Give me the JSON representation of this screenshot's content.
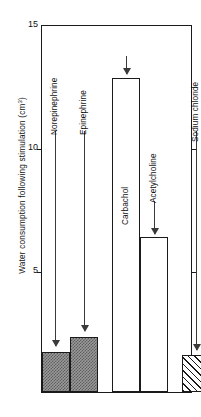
{
  "chart_data": {
    "type": "bar",
    "title": "",
    "xlabel": "",
    "ylabel": "Water consumption following stimulation (cm3)",
    "ylabel_main": "Water consumption  following  stimulation  (cm",
    "ylabel_exponent": "3",
    "ylabel_close": ")",
    "ylim": [
      0,
      15
    ],
    "yticks": [
      15,
      10,
      5
    ],
    "ytick_labels": [
      "15",
      "10",
      "5"
    ],
    "grid": false,
    "legend": "none",
    "categories": [
      "Norepinephrine",
      "Epinephrine",
      "Carbachol",
      "Acetylcholine",
      "Sodium chloride"
    ],
    "values": [
      1.65,
      2.25,
      12.8,
      6.3,
      1.5
    ],
    "bar_fills": [
      "checker",
      "checker",
      "none",
      "none",
      "hatch"
    ],
    "annotations": [
      {
        "label": "Norepinephrine",
        "points_to": "Norepinephrine"
      },
      {
        "label": "Epinephrine",
        "points_to": "Epinephrine"
      },
      {
        "label": "Carbachol",
        "points_to": "Carbachol"
      },
      {
        "label": "Acetylcholine",
        "points_to": "Acetylcholine"
      },
      {
        "label": "Sodium chloride",
        "points_to": "Sodium chloride"
      }
    ],
    "colors": {
      "axis": "#1a1a1a",
      "checker_fill": "#9a9a9a",
      "hatch_line": "#1a1a1a",
      "bar_outline": "#1a1a1a",
      "arrow": "#3a3a3a",
      "background": "#ffffff"
    }
  }
}
